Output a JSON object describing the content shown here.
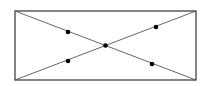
{
  "diagram": {
    "rectangle": {
      "x1": 15,
      "y1": 11,
      "x2": 196,
      "y2": 80,
      "stroke": "#333333"
    },
    "diagonals": [
      {
        "x1": 15,
        "y1": 11,
        "x2": 196,
        "y2": 80
      },
      {
        "x1": 15,
        "y1": 80,
        "x2": 196,
        "y2": 11
      }
    ],
    "points": [
      {
        "name": "upper-left-point",
        "x": 68,
        "y": 32
      },
      {
        "name": "center-point",
        "x": 105.5,
        "y": 45.5
      },
      {
        "name": "upper-right-point",
        "x": 156,
        "y": 27
      },
      {
        "name": "lower-left-point",
        "x": 68,
        "y": 61
      },
      {
        "name": "lower-right-point",
        "x": 152,
        "y": 64
      }
    ],
    "line_color": "#555555",
    "point_color": "#000000"
  }
}
